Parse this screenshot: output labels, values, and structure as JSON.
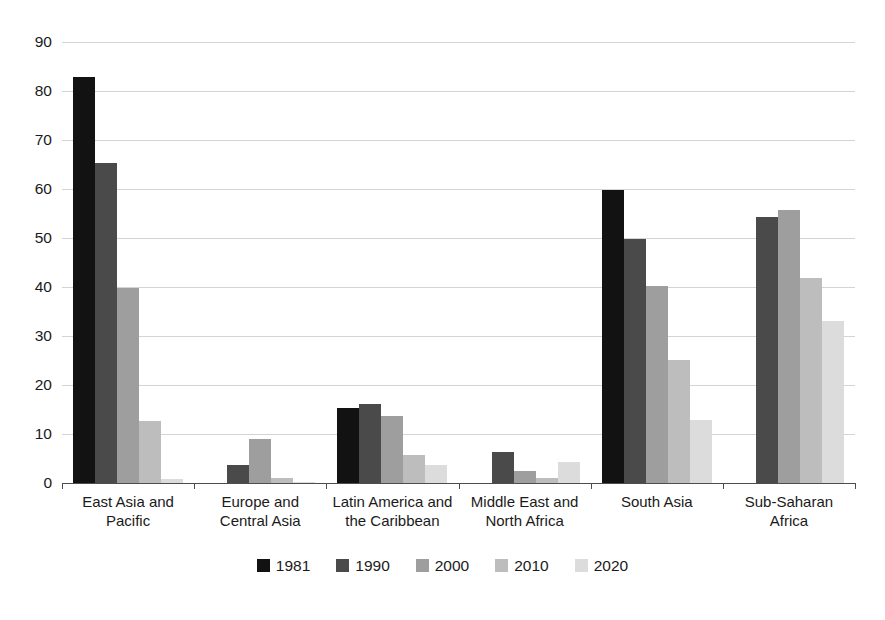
{
  "chart_data": {
    "type": "bar",
    "title": "",
    "subtitle": "",
    "xlabel": "",
    "ylabel": "",
    "ylim": [
      0,
      90
    ],
    "yticks": [
      0,
      10,
      20,
      30,
      40,
      50,
      60,
      70,
      80,
      90
    ],
    "grid": true,
    "legend_position": "bottom",
    "categories": [
      "East Asia and\nPacific",
      "Europe and\nCentral Asia",
      "Latin America and\nthe Caribbean",
      "Middle East and\nNorth Africa",
      "South Asia",
      "Sub-Saharan Africa"
    ],
    "series": [
      {
        "name": "1981",
        "color": "#121212",
        "values": [
          82.8,
          0,
          15.3,
          0,
          59.9,
          0
        ]
      },
      {
        "name": "1990",
        "color": "#4a4a4a",
        "values": [
          65.3,
          3.6,
          16.2,
          6.4,
          49.9,
          54.3
        ]
      },
      {
        "name": "2000",
        "color": "#9e9e9e",
        "values": [
          39.8,
          9.0,
          13.7,
          2.4,
          40.3,
          55.7
        ]
      },
      {
        "name": "2010",
        "color": "#bdbdbd",
        "values": [
          12.6,
          1.1,
          5.7,
          1.0,
          25.2,
          41.8
        ]
      },
      {
        "name": "2020",
        "color": "#dcdcdc",
        "values": [
          0.8,
          0.3,
          3.7,
          4.3,
          12.8,
          33.0
        ]
      }
    ]
  },
  "colors": {
    "gridline": "#d4d4d4",
    "axis": "#4d4d4d",
    "text": "#1a1a1a",
    "background": "#ffffff"
  }
}
